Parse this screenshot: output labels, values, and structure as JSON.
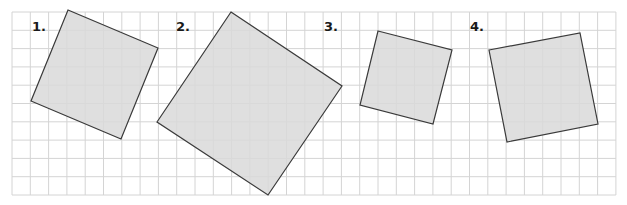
{
  "grid": {
    "x0": 12,
    "y0": 12,
    "cell": 18.3,
    "cols": 33,
    "rows": 10,
    "line_color": "#d4d4d4"
  },
  "style": {
    "fill": "#d9d9d9",
    "stroke": "#3a3a3a"
  },
  "figures": [
    {
      "label": "1.",
      "label_pos": [
        32,
        31
      ],
      "points": [
        [
          68,
          10
        ],
        [
          158,
          48
        ],
        [
          121,
          139
        ],
        [
          31,
          101
        ]
      ]
    },
    {
      "label": "2.",
      "label_pos": [
        176,
        31
      ],
      "points": [
        [
          231,
          12
        ],
        [
          342,
          86
        ],
        [
          268,
          195
        ],
        [
          157,
          122
        ]
      ]
    },
    {
      "label": "3.",
      "label_pos": [
        324,
        31
      ],
      "points": [
        [
          378,
          31
        ],
        [
          452,
          50
        ],
        [
          433,
          124
        ],
        [
          360,
          105
        ]
      ]
    },
    {
      "label": "4.",
      "label_pos": [
        470,
        31
      ],
      "points": [
        [
          489,
          50
        ],
        [
          580,
          33
        ],
        [
          598,
          124
        ],
        [
          507,
          142
        ]
      ]
    }
  ]
}
